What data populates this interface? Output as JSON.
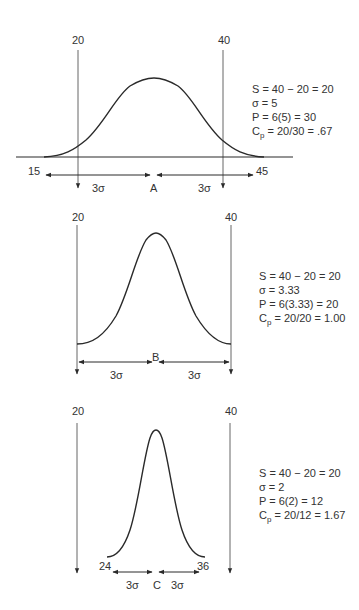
{
  "colors": {
    "line": "#2a2a2a",
    "spec_line": "#555555",
    "text": "#333333",
    "background": "#ffffff"
  },
  "diagrams": [
    {
      "id": "A",
      "lower_spec": "20",
      "upper_spec": "40",
      "left_tail": "15",
      "right_tail": "45",
      "center_label": "A",
      "half_width_left": "3σ",
      "half_width_right": "3σ",
      "equations": {
        "spread": "S = 40 − 20 = 20",
        "sigma": "σ = 5",
        "process": "P = 6(5) = 30",
        "cp_prefix": "C",
        "cp_sub": "p",
        "cp_rest": " = 20/30 = .67"
      }
    },
    {
      "id": "B",
      "lower_spec": "20",
      "upper_spec": "40",
      "center_label": "B",
      "half_width_left": "3σ",
      "half_width_right": "3σ",
      "equations": {
        "spread": "S = 40 − 20 = 20",
        "sigma": "σ = 3.33",
        "process": "P = 6(3.33) = 20",
        "cp_prefix": "C",
        "cp_sub": "p",
        "cp_rest": " = 20/20 = 1.00"
      }
    },
    {
      "id": "C",
      "lower_spec": "20",
      "upper_spec": "40",
      "left_tail": "24",
      "right_tail": "36",
      "center_label": "C",
      "half_width_left": "3σ",
      "half_width_right": "3σ",
      "equations": {
        "spread": "S = 40 − 20 = 20",
        "sigma": "σ = 2",
        "process": "P = 6(2) = 12",
        "cp_prefix": "C",
        "cp_sub": "p",
        "cp_rest": " = 20/12 = 1.67"
      }
    }
  ]
}
